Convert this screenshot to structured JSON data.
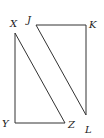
{
  "diagram": {
    "type": "geometry",
    "triangles": [
      {
        "name": "XYZ",
        "right_angle_at": "Y",
        "vertices": {
          "X": {
            "label": "X",
            "x": 15,
            "y": 33
          },
          "Y": {
            "label": "Y",
            "x": 15,
            "y": 123
          },
          "Z": {
            "label": "Z",
            "x": 65,
            "y": 123
          }
        }
      },
      {
        "name": "JKL",
        "right_angle_at": "K",
        "vertices": {
          "J": {
            "label": "J",
            "x": 36,
            "y": 25
          },
          "K": {
            "label": "K",
            "x": 86,
            "y": 25
          },
          "L": {
            "label": "L",
            "x": 86,
            "y": 115
          }
        }
      }
    ],
    "labels": {
      "X": "X",
      "Y": "Y",
      "Z": "Z",
      "J": "J",
      "K": "K",
      "L": "L"
    }
  }
}
